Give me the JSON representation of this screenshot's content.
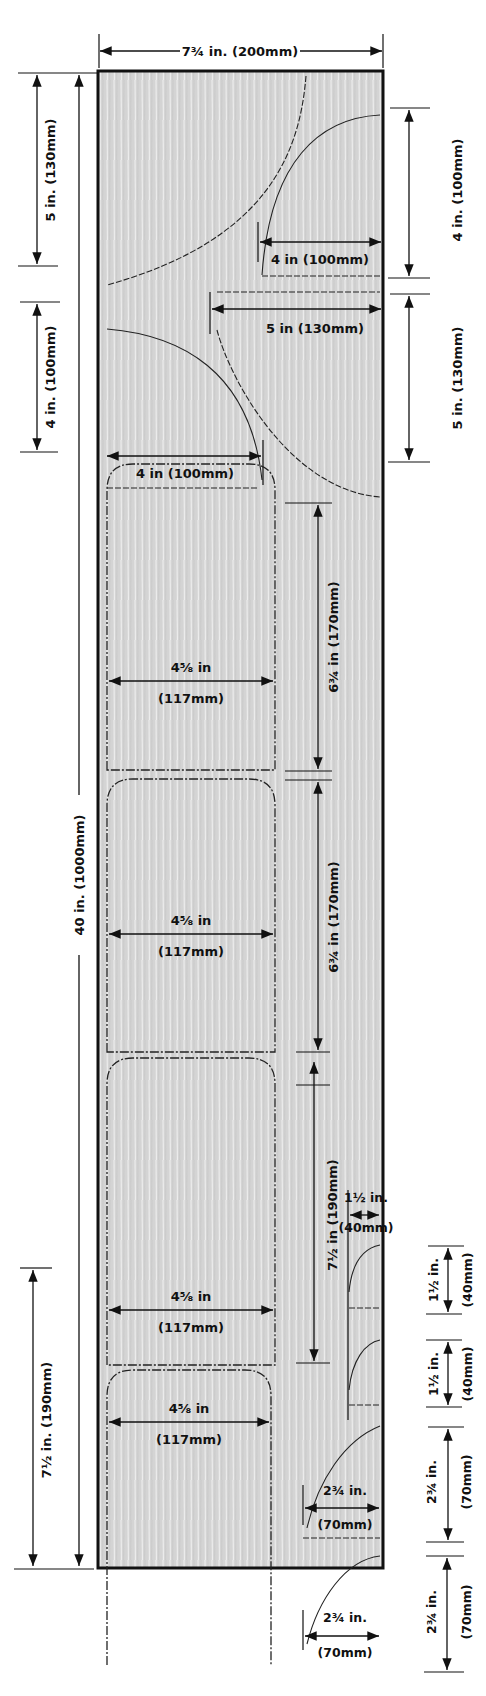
{
  "diagram": {
    "board": {
      "width_label": "7¾ in. (200mm)",
      "length_label": "40 in. (1000mm)",
      "width_in": 7.75,
      "length_in": 40,
      "fill_color": "#d6d6d6",
      "grain_color": "#f2f2f2",
      "outline_color": "#111111"
    },
    "left_dimensions": [
      {
        "id": "top-quarter",
        "label": "5 in. (130mm)"
      },
      {
        "id": "second-quarter",
        "label": "4 in. (100mm)"
      },
      {
        "id": "bottom-bay",
        "label": "7½ in. (190mm)"
      }
    ],
    "right_dimensions": [
      {
        "id": "r-quarter-1",
        "label": "4 in. (100mm)"
      },
      {
        "id": "r-quarter-2",
        "label": "5 in. (130mm)"
      },
      {
        "id": "r-small-1",
        "label_top": "1½ in.",
        "label_bottom": "(40mm)"
      },
      {
        "id": "r-small-2",
        "label_top": "1½ in.",
        "label_bottom": "(40mm)"
      },
      {
        "id": "r-medium-1",
        "label_top": "2¾ in.",
        "label_bottom": "(70mm)"
      },
      {
        "id": "r-medium-2",
        "label_top": "2¾ in.",
        "label_bottom": "(70mm)"
      }
    ],
    "inner_dimensions": {
      "arc1_radius": "4 in (100mm)",
      "arc2_radius": "5 in (130mm)",
      "arc3_radius": "4 in (100mm)",
      "panel_height_1": "6¾ in (170mm)",
      "panel_height_2": "6¾ in (170mm)",
      "panel_height_3": "7½ in (190mm)",
      "small_arc_width_top": "1½ in.",
      "small_arc_width_bottom": "(40mm)",
      "medium_arc_width_top": "2¾ in.",
      "medium_arc_width_bottom": "(70mm)"
    },
    "panels": [
      {
        "width_top": "4⅝ in",
        "width_bottom": "(117mm)"
      },
      {
        "width_top": "4⅝ in",
        "width_bottom": "(117mm)"
      },
      {
        "width_top": "4⅝ in",
        "width_bottom": "(117mm)"
      },
      {
        "width_top": "4⅝ in",
        "width_bottom": "(117mm)"
      }
    ]
  }
}
